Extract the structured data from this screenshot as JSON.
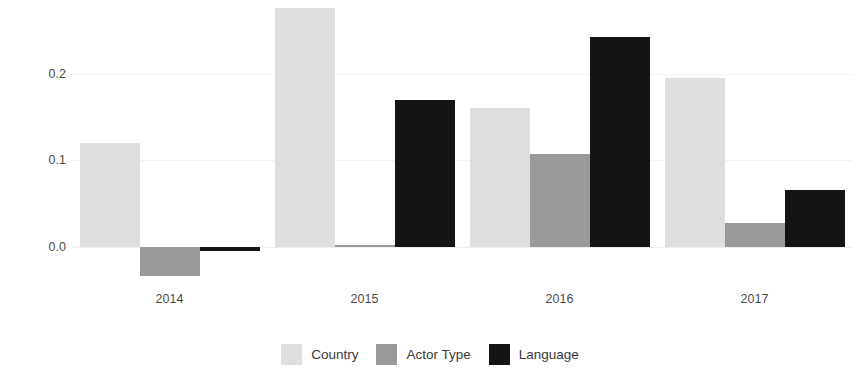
{
  "chart_data": {
    "type": "bar",
    "title": "",
    "subtitle": "",
    "xlabel": "",
    "ylabel": "Assortativity",
    "categories": [
      "2014",
      "2015",
      "2016",
      "2017"
    ],
    "series": [
      {
        "name": "Country",
        "color": "#dedede",
        "values": [
          0.12,
          0.276,
          0.16,
          0.195
        ]
      },
      {
        "name": "Actor Type",
        "color": "#9a9a9a",
        "values": [
          -0.034,
          0.002,
          0.107,
          0.028
        ]
      },
      {
        "name": "Language",
        "color": "#141414",
        "values": [
          -0.005,
          0.17,
          0.242,
          0.066
        ]
      }
    ],
    "ylim": [
      -0.045,
      0.285
    ],
    "yticks": [
      0.0,
      0.1,
      0.2
    ],
    "ytick_labels": [
      "0.0",
      "0.1",
      "0.2"
    ],
    "grid": true,
    "grid_color": "#f2f2f2",
    "legend_position": "bottom",
    "background": "#ffffff",
    "note_top_bar_clipped": "2015 Country bar extends to the top edge of the panel"
  }
}
